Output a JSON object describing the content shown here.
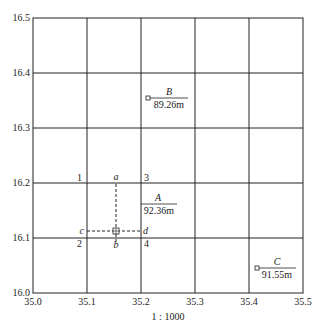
{
  "diagram": {
    "scale_label": "1 : 1000",
    "x_ticks": [
      "35.0",
      "35.1",
      "35.2",
      "35.3",
      "35.4",
      "35.5"
    ],
    "y_ticks": [
      "16.5",
      "16.4",
      "16.3",
      "16.2",
      "16.1",
      "16.0"
    ],
    "corner_labels": {
      "c1": "1",
      "c2": "2",
      "c3": "3",
      "c4": "4"
    },
    "construction_labels": {
      "a": "a",
      "b": "b",
      "c": "c",
      "d": "d"
    },
    "points": [
      {
        "name": "A",
        "elevation": "92.36m"
      },
      {
        "name": "B",
        "elevation": "89.26m"
      },
      {
        "name": "C",
        "elevation": "91.55m"
      }
    ]
  }
}
